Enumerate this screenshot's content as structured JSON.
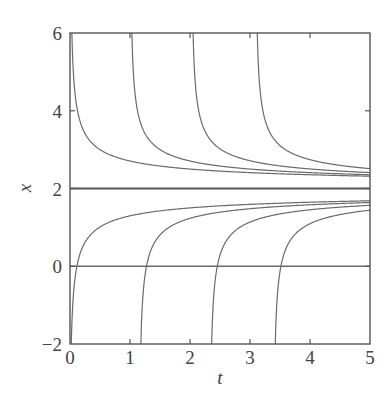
{
  "chart_data": {
    "type": "line",
    "title": "",
    "xlabel": "t",
    "ylabel": "x",
    "xlim": [
      0,
      5
    ],
    "ylim": [
      -2,
      6
    ],
    "xticks": [
      0,
      1,
      2,
      3,
      4,
      5
    ],
    "yticks": [
      -2,
      0,
      2,
      4,
      6
    ],
    "xtick_labels": [
      "0",
      "1",
      "2",
      "3",
      "4",
      "5"
    ],
    "ytick_labels": [
      "−2",
      "0",
      "2",
      "4",
      "6"
    ],
    "grid": false,
    "legend": null,
    "horizontal_lines": [
      {
        "name": "equilibrium x=2",
        "y": 2,
        "emphasis": true
      },
      {
        "name": "x=0 line",
        "y": 0,
        "emphasis": false
      }
    ],
    "model_note": "solution curves approximated by x = 2 ± 1/sqrt(2(t - c))",
    "series": [
      {
        "name": "upper-1",
        "branch": "above",
        "c": 0.0,
        "points": [
          [
            0.03,
            6.0
          ],
          [
            0.125,
            4.0
          ],
          [
            0.5,
            3.0
          ],
          [
            1,
            2.71
          ],
          [
            2,
            2.5
          ],
          [
            3,
            2.41
          ],
          [
            4,
            2.35
          ],
          [
            5,
            2.32
          ]
        ]
      },
      {
        "name": "upper-2",
        "branch": "above",
        "c": 1.0,
        "points": [
          [
            1.03,
            6.0
          ],
          [
            1.125,
            4.0
          ],
          [
            1.5,
            3.0
          ],
          [
            2,
            2.71
          ],
          [
            3,
            2.5
          ],
          [
            4,
            2.41
          ],
          [
            5,
            2.35
          ]
        ]
      },
      {
        "name": "upper-3",
        "branch": "above",
        "c": 2.02,
        "points": [
          [
            2.05,
            6.0
          ],
          [
            2.145,
            4.0
          ],
          [
            2.52,
            3.0
          ],
          [
            3.02,
            2.71
          ],
          [
            4,
            2.5
          ],
          [
            5,
            2.41
          ]
        ]
      },
      {
        "name": "upper-4",
        "branch": "above",
        "c": 3.09,
        "points": [
          [
            3.12,
            6.0
          ],
          [
            3.215,
            4.0
          ],
          [
            3.59,
            3.0
          ],
          [
            4.09,
            2.71
          ],
          [
            5,
            2.51
          ]
        ]
      },
      {
        "name": "lower-1",
        "branch": "below",
        "c": -0.01,
        "points": [
          [
            0.02,
            -2.0
          ],
          [
            0.115,
            0.0
          ],
          [
            0.5,
            1.0
          ],
          [
            1,
            1.29
          ],
          [
            2,
            1.5
          ],
          [
            3,
            1.59
          ],
          [
            4,
            1.65
          ],
          [
            5,
            1.68
          ]
        ]
      },
      {
        "name": "lower-2",
        "branch": "below",
        "c": 1.15,
        "points": [
          [
            1.18,
            -2.0
          ],
          [
            1.275,
            0.0
          ],
          [
            1.65,
            1.0
          ],
          [
            2.15,
            1.29
          ],
          [
            3.15,
            1.5
          ],
          [
            4.15,
            1.59
          ],
          [
            5,
            1.64
          ]
        ]
      },
      {
        "name": "lower-3",
        "branch": "below",
        "c": 2.33,
        "points": [
          [
            2.36,
            -2.0
          ],
          [
            2.455,
            0.0
          ],
          [
            2.83,
            1.0
          ],
          [
            3.33,
            1.29
          ],
          [
            4.33,
            1.5
          ],
          [
            5,
            1.57
          ]
        ]
      },
      {
        "name": "lower-4",
        "branch": "below",
        "c": 3.39,
        "points": [
          [
            3.42,
            -2.0
          ],
          [
            3.515,
            0.0
          ],
          [
            3.89,
            1.0
          ],
          [
            4.39,
            1.29
          ],
          [
            5,
            1.44
          ]
        ]
      }
    ],
    "colors": {
      "curve": "#6a6a6a",
      "axis": "#555555",
      "text": "#444444"
    }
  }
}
